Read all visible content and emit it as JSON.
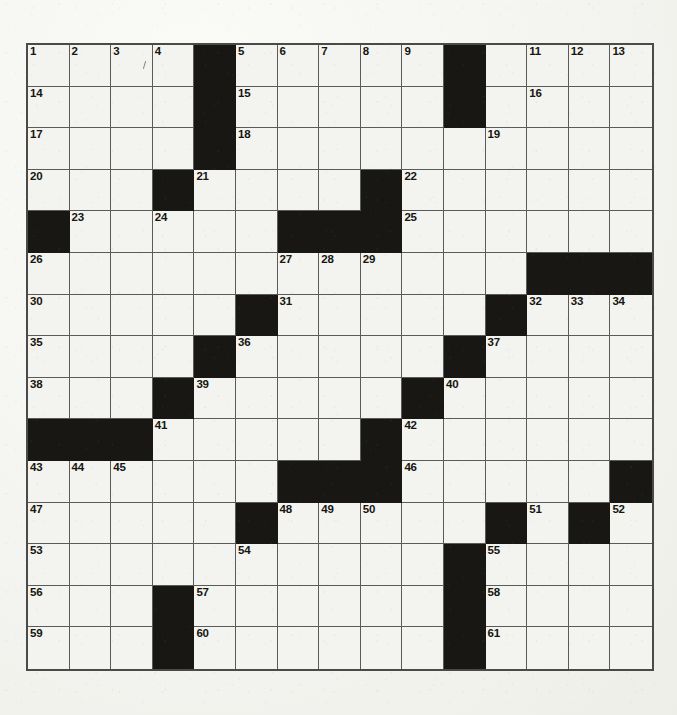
{
  "document": {
    "type": "crossword-puzzle-grid",
    "title": "Crossword Puzzle",
    "description": "Blank scanned newspaper-style crossword grid, 15 columns by 15 rows, with numbered entry squares and solid black blocking squares."
  },
  "grid": {
    "columns": 15,
    "rows": 15,
    "cell_size_px": 41.6,
    "origin_x_px": 26,
    "origin_y_px": 43,
    "total_clue_numbers": 61,
    "first_number": 1,
    "last_number": 61,
    "colors": {
      "paper": "#f3f3ef",
      "block": "#191714",
      "grid_line": "#5a5a5a",
      "outer_border": "#4a4a4a",
      "number_text": "#16150f"
    },
    "blocks": [
      [
        1,
        5
      ],
      [
        1,
        11
      ],
      [
        2,
        5
      ],
      [
        2,
        11
      ],
      [
        3,
        5
      ],
      [
        4,
        4
      ],
      [
        4,
        9
      ],
      [
        5,
        1
      ],
      [
        5,
        7
      ],
      [
        5,
        8
      ],
      [
        5,
        9
      ],
      [
        6,
        13
      ],
      [
        6,
        14
      ],
      [
        6,
        15
      ],
      [
        7,
        6
      ],
      [
        7,
        12
      ],
      [
        8,
        5
      ],
      [
        8,
        11
      ],
      [
        9,
        4
      ],
      [
        9,
        10
      ],
      [
        10,
        1
      ],
      [
        10,
        2
      ],
      [
        10,
        3
      ],
      [
        10,
        9
      ],
      [
        11,
        7
      ],
      [
        11,
        8
      ],
      [
        11,
        9
      ],
      [
        11,
        15
      ],
      [
        12,
        6
      ],
      [
        12,
        12
      ],
      [
        12,
        14
      ],
      [
        13,
        11
      ],
      [
        14,
        4
      ],
      [
        14,
        11
      ],
      [
        15,
        4
      ],
      [
        15,
        11
      ]
    ],
    "numbered_cells": [
      {
        "n": 1,
        "row": 1,
        "col": 1
      },
      {
        "n": 2,
        "row": 1,
        "col": 2
      },
      {
        "n": 3,
        "row": 1,
        "col": 3
      },
      {
        "n": 4,
        "row": 1,
        "col": 4
      },
      {
        "n": 5,
        "row": 1,
        "col": 6
      },
      {
        "n": 6,
        "row": 1,
        "col": 7
      },
      {
        "n": 7,
        "row": 1,
        "col": 8
      },
      {
        "n": 8,
        "row": 1,
        "col": 9
      },
      {
        "n": 9,
        "row": 1,
        "col": 10
      },
      {
        "n": 10,
        "row": 1,
        "col": 11
      },
      {
        "n": 11,
        "row": 1,
        "col": 13
      },
      {
        "n": 12,
        "row": 1,
        "col": 14
      },
      {
        "n": 13,
        "row": 1,
        "col": 15
      },
      {
        "n": 14,
        "row": 2,
        "col": 1
      },
      {
        "n": 15,
        "row": 2,
        "col": 6
      },
      {
        "n": 16,
        "row": 2,
        "col": 13
      },
      {
        "n": 17,
        "row": 3,
        "col": 1
      },
      {
        "n": 18,
        "row": 3,
        "col": 6
      },
      {
        "n": 19,
        "row": 3,
        "col": 12
      },
      {
        "n": 20,
        "row": 4,
        "col": 1
      },
      {
        "n": 21,
        "row": 4,
        "col": 5
      },
      {
        "n": 22,
        "row": 4,
        "col": 10
      },
      {
        "n": 23,
        "row": 5,
        "col": 2
      },
      {
        "n": 24,
        "row": 5,
        "col": 4
      },
      {
        "n": 25,
        "row": 5,
        "col": 10
      },
      {
        "n": 26,
        "row": 6,
        "col": 1
      },
      {
        "n": 27,
        "row": 6,
        "col": 7
      },
      {
        "n": 28,
        "row": 6,
        "col": 8
      },
      {
        "n": 29,
        "row": 6,
        "col": 9
      },
      {
        "n": 30,
        "row": 7,
        "col": 1
      },
      {
        "n": 31,
        "row": 7,
        "col": 7
      },
      {
        "n": 32,
        "row": 7,
        "col": 13
      },
      {
        "n": 33,
        "row": 7,
        "col": 14
      },
      {
        "n": 34,
        "row": 7,
        "col": 15
      },
      {
        "n": 35,
        "row": 8,
        "col": 1
      },
      {
        "n": 36,
        "row": 8,
        "col": 6
      },
      {
        "n": 37,
        "row": 8,
        "col": 12
      },
      {
        "n": 38,
        "row": 9,
        "col": 1
      },
      {
        "n": 39,
        "row": 9,
        "col": 5
      },
      {
        "n": 40,
        "row": 9,
        "col": 11
      },
      {
        "n": 41,
        "row": 10,
        "col": 4
      },
      {
        "n": 42,
        "row": 10,
        "col": 10
      },
      {
        "n": 43,
        "row": 11,
        "col": 1
      },
      {
        "n": 44,
        "row": 11,
        "col": 2
      },
      {
        "n": 45,
        "row": 11,
        "col": 3
      },
      {
        "n": 46,
        "row": 11,
        "col": 10
      },
      {
        "n": 47,
        "row": 12,
        "col": 1
      },
      {
        "n": 48,
        "row": 12,
        "col": 7
      },
      {
        "n": 49,
        "row": 12,
        "col": 8
      },
      {
        "n": 50,
        "row": 12,
        "col": 9
      },
      {
        "n": 51,
        "row": 12,
        "col": 13
      },
      {
        "n": 52,
        "row": 12,
        "col": 15
      },
      {
        "n": 53,
        "row": 13,
        "col": 1
      },
      {
        "n": 54,
        "row": 13,
        "col": 6
      },
      {
        "n": 55,
        "row": 13,
        "col": 12
      },
      {
        "n": 56,
        "row": 14,
        "col": 1
      },
      {
        "n": 57,
        "row": 14,
        "col": 5
      },
      {
        "n": 58,
        "row": 14,
        "col": 12
      },
      {
        "n": 59,
        "row": 15,
        "col": 1
      },
      {
        "n": 60,
        "row": 15,
        "col": 5
      },
      {
        "n": 61,
        "row": 15,
        "col": 12
      }
    ],
    "entries": []
  }
}
